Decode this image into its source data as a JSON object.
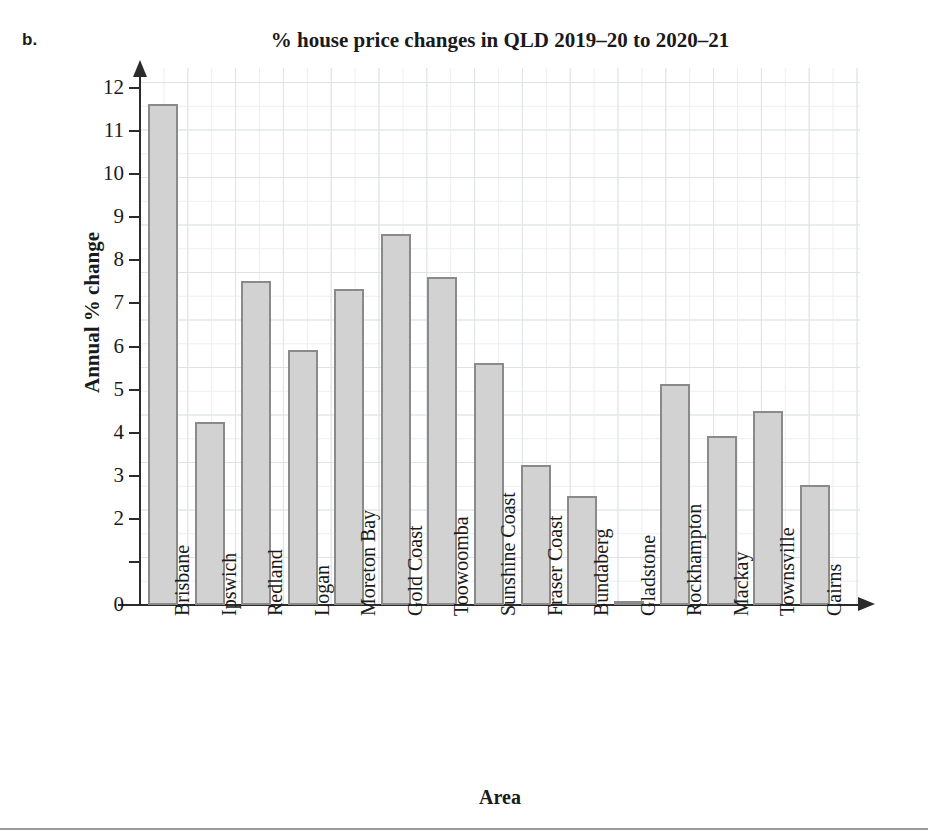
{
  "figure": {
    "part_label": "b.",
    "bottom_rule": true
  },
  "chart_data": {
    "type": "bar",
    "title": "% house price changes in QLD 2019–20 to 2020–21",
    "xlabel": "Area",
    "ylabel": "Annual % change",
    "ylim": [
      0,
      12
    ],
    "ytick_values": [
      0,
      2,
      3,
      4,
      5,
      6,
      7,
      8,
      9,
      10,
      11,
      12
    ],
    "ytick_labels": [
      "0",
      "2",
      "3",
      "4",
      "5",
      "6",
      "7",
      "8",
      "9",
      "10",
      "11",
      "12"
    ],
    "grid": true,
    "legend": false,
    "bar_fill_color": "#d2d2d2",
    "bar_edge_color": "#8a8a8a",
    "categories": [
      "Brisbane",
      "Ipswich",
      "Redland",
      "Logan",
      "Moreton Bay",
      "Gold Coast",
      "Toowoomba",
      "Sunshine Coast",
      "Fraser Coast",
      "Bundaberg",
      "Gladstone",
      "Rockhampton",
      "Mackay",
      "Townsville",
      "Cairns"
    ],
    "values": [
      11.62,
      4.25,
      7.53,
      5.93,
      7.33,
      8.62,
      7.62,
      5.62,
      3.24,
      2.52,
      0.06,
      5.12,
      3.92,
      4.51,
      2.79
    ]
  }
}
